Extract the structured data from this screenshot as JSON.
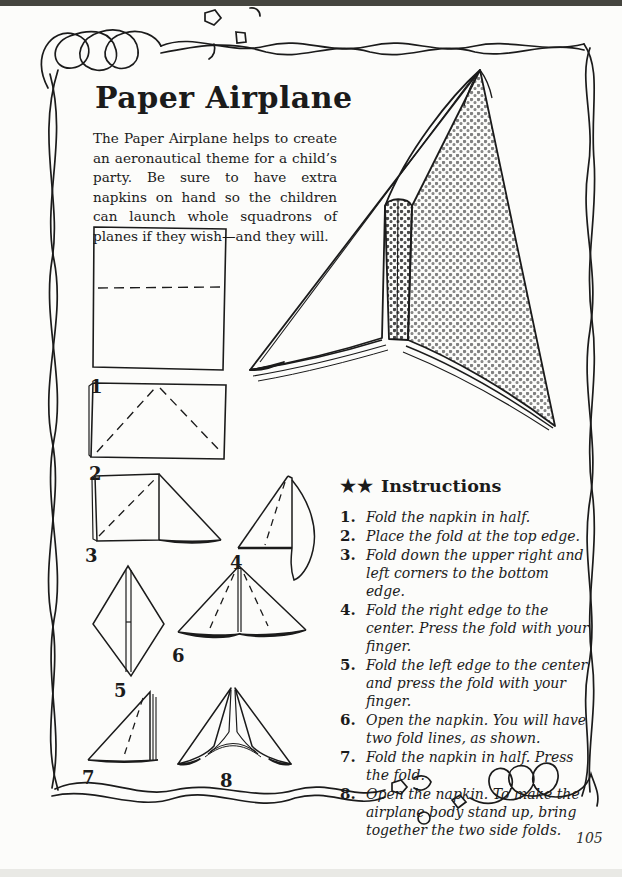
{
  "page": {
    "title": "Paper Airplane",
    "intro": "The Paper Airplane helps to create an aeronautical theme for a child’s party. Be sure to have extra napkins on hand so the children can launch whole squadrons of planes if they wish—and they will.",
    "page_number": "105"
  },
  "instructions": {
    "stars": "★★",
    "heading": "Instructions",
    "items": [
      {
        "num": "1.",
        "text": "Fold the napkin in half."
      },
      {
        "num": "2.",
        "text": "Place the fold at the top edge."
      },
      {
        "num": "3.",
        "text": "Fold down the upper right and left corners to the bottom edge."
      },
      {
        "num": "4.",
        "text": "Fold the right edge to the center. Press the fold with your finger."
      },
      {
        "num": "5.",
        "text": "Fold the left edge to the center and press the fold with your finger."
      },
      {
        "num": "6.",
        "text": "Open the napkin. You will have two fold lines, as shown."
      },
      {
        "num": "7.",
        "text": "Fold the napkin in half. Press the fold."
      },
      {
        "num": "8.",
        "text": "Open the napkin. To make the airplane body stand up, bring together the two side folds."
      }
    ]
  },
  "figures": {
    "step1": "1",
    "step2": "2",
    "step3": "3",
    "step4": "4",
    "step5": "5",
    "step6": "6",
    "step7": "7",
    "step8": "8"
  },
  "colors": {
    "ink": "#1b1b1b",
    "paper": "#fcfcfa",
    "scan_edge_top": "#45453f",
    "scan_edge_bottom": "#e9e9e5"
  }
}
